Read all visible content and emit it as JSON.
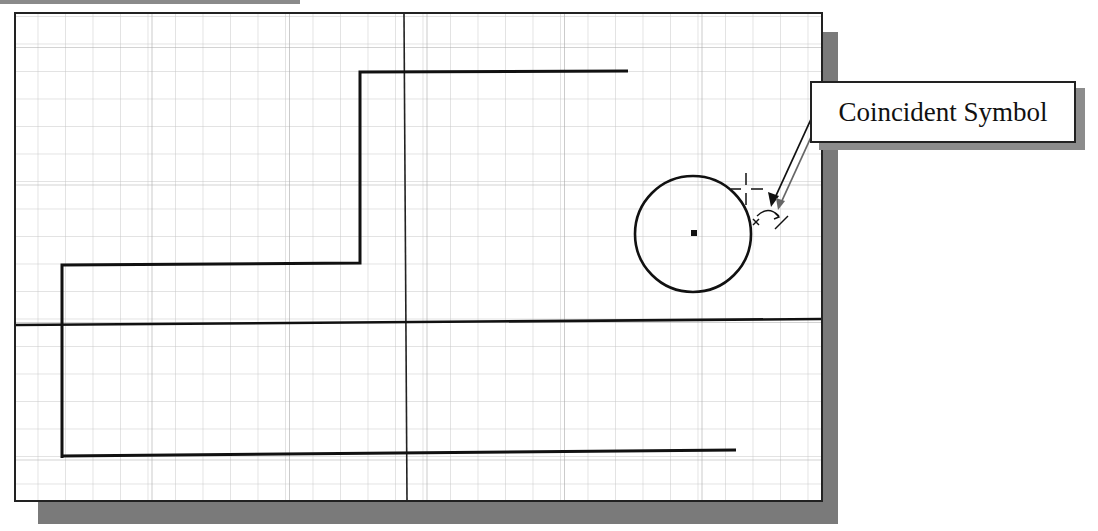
{
  "figure": {
    "callout": {
      "label": "Coincident Symbol"
    },
    "colors": {
      "grid": "#c8c8c8",
      "geometry": "#111111",
      "shadow": "#7a7a7a",
      "background": "#ffffff"
    },
    "grid": {
      "spacing_px": 27.5,
      "origin_x": 406,
      "origin_y": 322
    },
    "elements": [
      {
        "type": "polyline",
        "name": "upper-profile",
        "points": [
          [
            62,
            458
          ],
          [
            62,
            265
          ],
          [
            360,
            265
          ],
          [
            360,
            72
          ],
          [
            628,
            72
          ]
        ]
      },
      {
        "type": "line",
        "name": "bottom-line",
        "from": [
          62,
          455
        ],
        "to": [
          736,
          451
        ]
      },
      {
        "type": "line",
        "name": "horizontal-axis",
        "from": [
          16,
          325
        ],
        "to": [
          822,
          319
        ]
      },
      {
        "type": "line",
        "name": "vertical-axis",
        "from": [
          404,
          14
        ],
        "to": [
          407,
          502
        ]
      },
      {
        "type": "circle",
        "name": "sketch-circle",
        "cx": 693,
        "cy": 234,
        "r": 58
      },
      {
        "type": "point",
        "name": "circle-center",
        "x": 694,
        "y": 233
      },
      {
        "type": "symbol",
        "name": "coincident-constraint-symbol",
        "x": 765,
        "y": 212
      },
      {
        "type": "cursor",
        "name": "crosshair-cursor",
        "x": 746,
        "y": 189
      }
    ]
  }
}
